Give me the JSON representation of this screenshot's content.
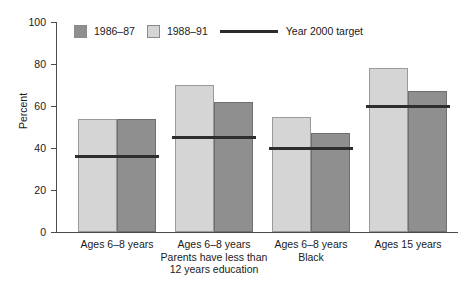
{
  "chart_data": {
    "type": "bar",
    "title": "",
    "xlabel": "",
    "ylabel": "Percent",
    "ylim": [
      0,
      100
    ],
    "yticks": [
      0,
      20,
      40,
      60,
      80,
      100
    ],
    "grid": false,
    "legend_position": "top-left",
    "categories": [
      "Ages 6–8 years",
      "Ages 6–8 years\nParents have less than\n12 years education",
      "Ages 6–8 years\nBlack",
      "Ages 15 years"
    ],
    "category_lines": [
      [
        "Ages 6–8 years"
      ],
      [
        "Ages 6–8 years",
        "Parents have less than",
        "12 years education"
      ],
      [
        "Ages 6–8 years",
        "Black"
      ],
      [
        "Ages 15 years"
      ]
    ],
    "series": [
      {
        "name": "1988–91",
        "key": "light",
        "color": "#d5d5d5",
        "values": [
          54,
          70,
          55,
          78
        ]
      },
      {
        "name": "1986–87",
        "key": "dark",
        "color": "#8f8f8f",
        "values": [
          54,
          62,
          47,
          67
        ]
      }
    ],
    "target_series": {
      "name": "Year 2000 target",
      "color": "#2e2e2e",
      "values": [
        36,
        45,
        40,
        60
      ]
    },
    "annotations": []
  },
  "legend": {
    "items": [
      {
        "label": "1986–87",
        "marker": "swatch",
        "color": "#8f8f8f"
      },
      {
        "label": "1988–91",
        "marker": "swatch",
        "color": "#d5d5d5"
      },
      {
        "label": "Year 2000 target",
        "marker": "line",
        "color": "#2e2e2e"
      }
    ]
  },
  "axis": {
    "y_label": "Percent",
    "y_ticks": [
      "100",
      "80",
      "60",
      "40",
      "20",
      "0"
    ]
  }
}
